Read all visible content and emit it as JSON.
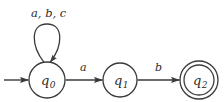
{
  "diagram": {
    "type": "finite-state-automaton",
    "background_color": "#ffffff",
    "stroke_color": "#3a3a3a",
    "text_color": "#2b2b2b",
    "states": [
      {
        "id": "q0",
        "label": "q",
        "subscript": "0",
        "kind": "start",
        "cx": 47,
        "cy": 80,
        "r": 18
      },
      {
        "id": "q1",
        "label": "q",
        "subscript": "1",
        "kind": "normal",
        "cx": 120,
        "cy": 80,
        "r": 17
      },
      {
        "id": "q2",
        "label": "q",
        "subscript": "2",
        "kind": "accepting",
        "cx": 199,
        "cy": 80,
        "r": 19,
        "inner_r": 15
      }
    ],
    "transitions": [
      {
        "from": "q0",
        "to": "q0",
        "label": "a, b, c",
        "shape": "self-loop"
      },
      {
        "from": "q0",
        "to": "q1",
        "label": "a",
        "shape": "straight"
      },
      {
        "from": "q1",
        "to": "q2",
        "label": "b",
        "shape": "straight"
      }
    ],
    "start_arrow": {
      "name": "start-arrow",
      "from_x": 4,
      "to_x": 28,
      "y": 80
    }
  }
}
